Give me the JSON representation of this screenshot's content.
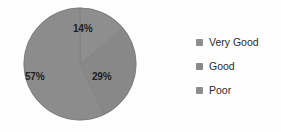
{
  "chart_data": {
    "type": "pie",
    "title": "",
    "categories": [
      "Very Good",
      "Good",
      "Poor"
    ],
    "values": [
      14,
      29,
      57
    ],
    "data_labels": [
      "14%",
      "29%",
      "57%"
    ],
    "units": "percent",
    "legend_position": "right",
    "grid": false,
    "slice_colors": [
      "#8e8e8e",
      "#888888",
      "#8c8c8c"
    ],
    "start_angle_deg": 0,
    "direction": "clockwise",
    "background_color": "#ffffff",
    "label_color": "#1d1d1d"
  },
  "pie": {
    "labels": {
      "very_good": "14%",
      "good": "29%",
      "poor": "57%"
    }
  },
  "legend": {
    "items": [
      {
        "label": "Very Good",
        "color": "#8e8e8e"
      },
      {
        "label": "Good",
        "color": "#888888"
      },
      {
        "label": "Poor",
        "color": "#8c8c8c"
      }
    ]
  }
}
